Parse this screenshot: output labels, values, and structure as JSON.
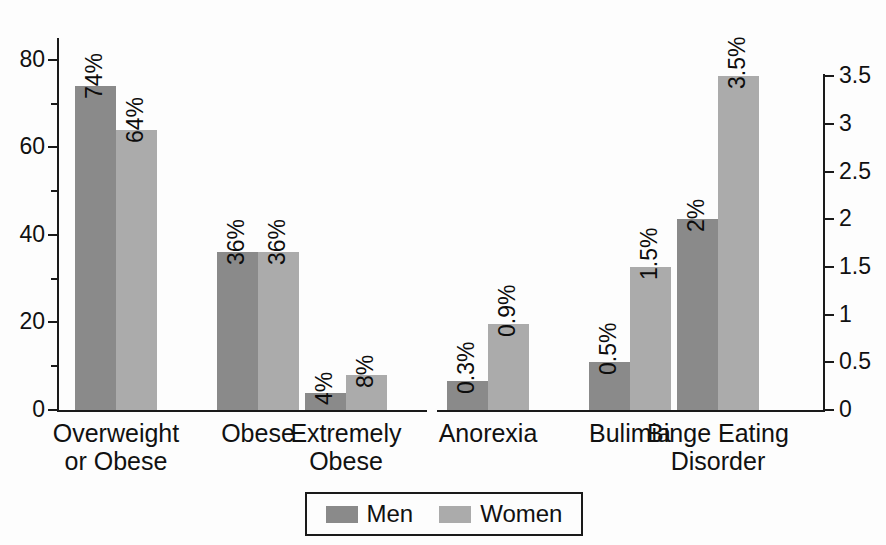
{
  "chart_data": {
    "type": "bar",
    "title": "",
    "subtitle": "",
    "xlabel": "",
    "ylabel": "",
    "grid": false,
    "legend_position": "bottom",
    "categories": [
      "Overweight\nor Obese",
      "Obese",
      "Extremely\nObese",
      "Anorexia",
      "Bulimia",
      "Binge Eating\nDisorder"
    ],
    "series": [
      {
        "name": "Men",
        "color": "#8a8a8a",
        "values": [
          74,
          36,
          4,
          0.3,
          0.5,
          2
        ],
        "labels": [
          "74%",
          "36%",
          "4%",
          "0.3%",
          "0.5%",
          "2%"
        ]
      },
      {
        "name": "Women",
        "color": "#ababab",
        "values": [
          64,
          36,
          8,
          0.9,
          1.5,
          3.5
        ],
        "labels": [
          "64%",
          "36%",
          "8%",
          "0.9%",
          "1.5%",
          "3.5%"
        ]
      }
    ],
    "panels": [
      {
        "name": "obesity",
        "axis": "left",
        "categories": [
          "Overweight\nor Obese",
          "Obese",
          "Extremely\nObese"
        ]
      },
      {
        "name": "eating-disorders",
        "axis": "right",
        "categories": [
          "Anorexia",
          "Bulimia",
          "Binge Eating\nDisorder"
        ]
      }
    ],
    "axes": {
      "left": {
        "ylim": [
          0,
          85
        ],
        "major_ticks": [
          0,
          20,
          40,
          60,
          80
        ],
        "tick_labels": [
          "0",
          "20",
          "40",
          "60",
          "80"
        ],
        "minor_ticks": [
          10,
          30,
          50,
          70
        ]
      },
      "right": {
        "ylim": [
          0,
          3.9
        ],
        "major_ticks": [
          0,
          0.5,
          1,
          1.5,
          2,
          2.5,
          3,
          3.5
        ],
        "tick_labels": [
          "0",
          "0.5",
          "1",
          "1.5",
          "2",
          "2.5",
          "3",
          "3.5"
        ],
        "minor_ticks": []
      }
    }
  },
  "legend": {
    "items": [
      {
        "label": "Men",
        "color": "#8a8a8a"
      },
      {
        "label": "Women",
        "color": "#ababab"
      }
    ]
  },
  "colors": {
    "men": "#8a8a8a",
    "women": "#ababab",
    "axis": "#1a1a1a",
    "text": "#111111",
    "background": "#fdfdfd"
  }
}
